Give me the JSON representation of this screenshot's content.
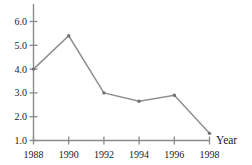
{
  "chart_data": {
    "type": "line",
    "title": "",
    "subtitle": "",
    "xlabel": "Year",
    "ylabel": "",
    "x": [
      1988,
      1990,
      1992,
      1994,
      1996,
      1998
    ],
    "categories": [
      "1988",
      "1990",
      "1992",
      "1994",
      "1996",
      "1998"
    ],
    "values": [
      4.0,
      5.4,
      3.0,
      2.65,
      2.9,
      1.3
    ],
    "series": [
      {
        "name": "",
        "values": [
          4.0,
          5.4,
          3.0,
          2.65,
          2.9,
          1.3
        ]
      }
    ],
    "xlim": [
      1988,
      1998
    ],
    "ylim": [
      1.0,
      6.0
    ],
    "ytick_labels": [
      "1.0",
      "2.0",
      "3.0",
      "4.0",
      "5.0",
      "6.0"
    ],
    "ytick_values": [
      1.0,
      2.0,
      3.0,
      4.0,
      5.0,
      6.0
    ],
    "xtick_labels": [
      "1988",
      "1990",
      "1992",
      "1994",
      "1996",
      "1998"
    ],
    "xtick_values": [
      1988,
      1990,
      1992,
      1994,
      1996,
      1998
    ],
    "grid": false,
    "legend": false,
    "legend_position": "none",
    "markers": true,
    "line_color": "#8f8f8f",
    "marker_color": "#6f6f6f",
    "axis_color": "#8a8a8a",
    "text_color": "#1a1a1a",
    "background_color": "#ffffff",
    "annotations": []
  },
  "axes": {
    "x_title": "Year",
    "y_title": ""
  },
  "ticks": {
    "y": [
      {
        "label": "6.0",
        "value": 6.0
      },
      {
        "label": "5.0",
        "value": 5.0
      },
      {
        "label": "4.0",
        "value": 4.0
      },
      {
        "label": "3.0",
        "value": 3.0
      },
      {
        "label": "2.0",
        "value": 2.0
      },
      {
        "label": "1.0",
        "value": 1.0
      }
    ],
    "x": [
      {
        "label": "1988",
        "value": 1988
      },
      {
        "label": "1990",
        "value": 1990
      },
      {
        "label": "1992",
        "value": 1992
      },
      {
        "label": "1994",
        "value": 1994
      },
      {
        "label": "1996",
        "value": 1996
      },
      {
        "label": "1998",
        "value": 1998
      }
    ]
  }
}
